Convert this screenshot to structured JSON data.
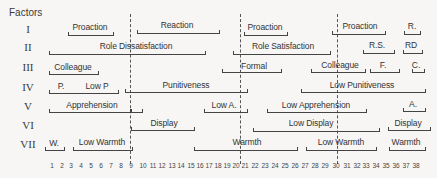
{
  "heading": "Factors",
  "factors": [
    "I",
    "II",
    "III",
    "IV",
    "V",
    "VI",
    "VII"
  ],
  "axis_ticks": [
    "1",
    "2",
    "3",
    "4",
    "5",
    "6",
    "7",
    "8",
    "9",
    "10",
    "11",
    "12",
    "13",
    "14",
    "15",
    "16",
    "17",
    "18",
    "19",
    "20",
    "21",
    "22",
    "23",
    "24",
    "25",
    "26",
    "27",
    "28",
    "29",
    "30",
    "31",
    "32",
    "33",
    "34",
    "35",
    "36",
    "37",
    "38"
  ],
  "dividers_after_tick": [
    "9",
    "20",
    "30"
  ],
  "rows": {
    "I": [
      {
        "label": "Proaction",
        "from": 3,
        "to": 7
      },
      {
        "label": "Reaction",
        "from": 10,
        "to": 18
      },
      {
        "label": "Proaction",
        "from": 21,
        "to": 25
      },
      {
        "label": "Proaction",
        "from": 30,
        "to": 35
      },
      {
        "label": "R.",
        "from": 37,
        "to": 38
      }
    ],
    "II": [
      {
        "label": "Role Dissatisfaction",
        "from": 1,
        "to": 16
      },
      {
        "label": "Role Satisfaction",
        "from": 20,
        "to": 30
      },
      {
        "label": "R.S.",
        "from": 33,
        "to": 35
      },
      {
        "label": "RD",
        "from": 36,
        "to": 38
      }
    ],
    "III": [
      {
        "label": "Colleague",
        "from": 1,
        "to": 6
      },
      {
        "label": "Formal",
        "from": 19,
        "to": 25
      },
      {
        "label": "Colleague",
        "from": 28,
        "to": 33
      },
      {
        "label": "F.",
        "from": 34,
        "to": 36
      },
      {
        "label": "C.",
        "from": 37,
        "to": 38
      }
    ],
    "IV": [
      {
        "label": "P.",
        "from": 1,
        "to": 2
      },
      {
        "label": "Low P",
        "from": 3,
        "to": 8
      },
      {
        "label": "Punitiveness",
        "from": 9,
        "to": 21
      },
      {
        "label": "Low Punitiveness",
        "from": 27,
        "to": 38
      }
    ],
    "V": [
      {
        "label": "Apprehension",
        "from": 1,
        "to": 9
      },
      {
        "label": "",
        "from": 9,
        "to": 10
      },
      {
        "label": "Low A.",
        "from": 16,
        "to": 21
      },
      {
        "label": "Low Apprehension",
        "from": 23,
        "to": 33
      },
      {
        "label": "A.",
        "from": 37,
        "to": 38
      }
    ],
    "VI": [
      {
        "label": "Display",
        "from": 9,
        "to": 15
      },
      {
        "label": "Low Display",
        "from": 22,
        "to": 34
      },
      {
        "label": "Display",
        "from": 35,
        "to": 38
      }
    ],
    "VII": [
      {
        "label": "W.",
        "from": 1,
        "to": 2
      },
      {
        "label": "Low Warmth",
        "from": 3,
        "to": 9
      },
      {
        "label": "Warmth",
        "from": 15,
        "to": 26
      },
      {
        "label": "Low Warmth",
        "from": 27,
        "to": 34
      },
      {
        "label": "Warmth",
        "from": 35,
        "to": 38
      }
    ]
  },
  "labels": {
    "I_0": "Proaction",
    "I_1": "Reaction",
    "I_2": "Proaction",
    "I_3": "Proaction",
    "I_4": "R.",
    "II_0": "Role Dissatisfaction",
    "II_1": "Role Satisfaction",
    "II_2": "R.S.",
    "II_3": "RD",
    "III_0": "Colleague",
    "III_1": "Formal",
    "III_2": "Colleague",
    "III_3": "F.",
    "III_4": "C.",
    "IV_0": "P.",
    "IV_1": "Low P",
    "IV_2": "Punitiveness",
    "IV_3": "Low Punitiveness",
    "V_0": "Apprehension",
    "V_1": "Low A.",
    "V_2": "Low Apprehension",
    "V_3": "A.",
    "VI_0": "Display",
    "VI_1": "Low Display",
    "VI_2": "Display",
    "VII_0": "W.",
    "VII_1": "Low Warmth",
    "VII_2": "Warmth",
    "VII_3": "Low Warmth",
    "VII_4": "Warmth"
  }
}
